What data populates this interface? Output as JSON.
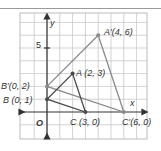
{
  "diagram": {
    "type": "coordinate-plane-dilation",
    "axes": {
      "x_label": "x",
      "y_label": "y",
      "origin_label": "O",
      "y_tick_label": "5"
    },
    "grid": {
      "x_min": -2,
      "x_max": 7,
      "y_min": -2,
      "y_max": 7,
      "color": "#c8c8c8"
    },
    "original_triangle": {
      "color": "#4a4a4a",
      "vertices": [
        {
          "name": "A",
          "x": 2,
          "y": 3,
          "label": "A (2, 3)"
        },
        {
          "name": "B",
          "x": 0,
          "y": 1,
          "label": "B (0, 1)"
        },
        {
          "name": "C",
          "x": 3,
          "y": 0,
          "label": "C (3, 0)"
        }
      ]
    },
    "image_triangle": {
      "color": "#8a8a8a",
      "vertices": [
        {
          "name": "A'",
          "x": 4,
          "y": 6,
          "label": "A′(4, 6)"
        },
        {
          "name": "B'",
          "x": 0,
          "y": 2,
          "label": "B′(0, 2)"
        },
        {
          "name": "C'",
          "x": 6,
          "y": 0,
          "label": "C′(6, 0)"
        }
      ]
    }
  }
}
